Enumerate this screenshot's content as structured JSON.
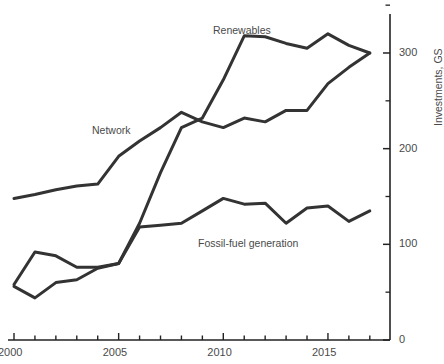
{
  "chart_data": {
    "type": "line",
    "title": "",
    "xlabel": "",
    "ylabel": "Investments, GS",
    "xlim": [
      2000,
      2018
    ],
    "ylim": [
      0,
      350
    ],
    "grid": false,
    "legend_position": "inline-labels",
    "y_axis_side": "right",
    "y_ticks_major": [
      0,
      100,
      200,
      300
    ],
    "y_ticks_minor": [
      50,
      150,
      250,
      350
    ],
    "y_tick_labels": [
      "0",
      "100",
      "200",
      "300"
    ],
    "x_ticks": [
      2000,
      2001,
      2002,
      2003,
      2004,
      2005,
      2006,
      2007,
      2008,
      2009,
      2010,
      2011,
      2012,
      2013,
      2014,
      2015,
      2016,
      2017
    ],
    "x_tick_labels_shown": [
      "2000",
      "2005",
      "2010",
      "2015"
    ],
    "x": [
      2000,
      2001,
      2002,
      2003,
      2004,
      2005,
      2006,
      2007,
      2008,
      2009,
      2010,
      2011,
      2012,
      2013,
      2014,
      2015,
      2016,
      2017
    ],
    "series": [
      {
        "name": "Network",
        "color": "#333333",
        "values": [
          148,
          152,
          157,
          161,
          163,
          192,
          208,
          222,
          238,
          228,
          222,
          232,
          228,
          240,
          240,
          268,
          285,
          300
        ]
      },
      {
        "name": "Renewables",
        "color": "#333333",
        "values": [
          56,
          44,
          60,
          63,
          75,
          80,
          122,
          175,
          222,
          232,
          272,
          318,
          317,
          310,
          305,
          320,
          308,
          300
        ]
      },
      {
        "name": "Fossil-fuel generation",
        "color": "#333333",
        "values": [
          58,
          92,
          88,
          76,
          76,
          80,
          118,
          120,
          122,
          135,
          148,
          142,
          143,
          122,
          138,
          140,
          124,
          135
        ]
      }
    ],
    "annotations": [
      {
        "text": "Network",
        "x_px": 92,
        "y_px": 124
      },
      {
        "text": "Renewables",
        "x_px": 213,
        "y_px": 24
      },
      {
        "text": "Fossil-fuel generation",
        "x_px": 198,
        "y_px": 237
      }
    ]
  }
}
